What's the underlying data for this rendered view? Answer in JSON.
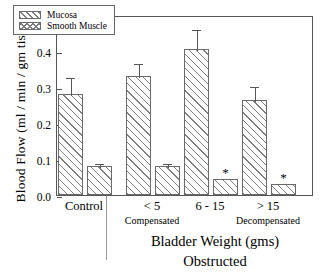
{
  "chart_data": {
    "type": "bar",
    "title": "",
    "xlabel": "Bladder  Weight (gms)",
    "xsublabel": "Obstructed",
    "ylabel": "Blood  Flow  (ml / min / gm tissue)",
    "ylim": [
      0.0,
      0.5
    ],
    "ytick_labels": [
      "0.0",
      "0.1",
      "0.2",
      "0.3",
      "0.4",
      "0.5"
    ],
    "ytick_values": [
      0.0,
      0.1,
      0.2,
      0.3,
      0.4,
      0.5
    ],
    "grid": false,
    "legend_position": "upper-left",
    "categories": [
      "Control",
      "< 5",
      "6 - 15",
      "> 15"
    ],
    "category_sublabels": [
      "",
      "Compensated",
      "",
      "Decompensated"
    ],
    "series": [
      {
        "name": "Mucosa",
        "pattern": "diagonal-hatch",
        "values": [
          0.28,
          0.33,
          0.405,
          0.265
        ],
        "errors_upper": [
          0.33,
          0.37,
          0.465,
          0.305
        ],
        "significance": [
          "",
          "",
          "",
          ""
        ]
      },
      {
        "name": "Smooth  Muscle",
        "pattern": "cross-hatch",
        "values": [
          0.08,
          0.08,
          0.045,
          0.03
        ],
        "errors_upper": [
          0.092,
          0.092,
          0.0,
          0.0
        ],
        "significance": [
          "",
          "",
          "*",
          "*"
        ]
      }
    ],
    "significance_marker": "*"
  },
  "legend": {
    "items": [
      {
        "label": "Mucosa"
      },
      {
        "label": "Smooth  Muscle"
      }
    ]
  },
  "axis": {
    "y_title": "Blood  Flow  (ml / min / gm tissue)",
    "x_title": "Bladder  Weight (gms)",
    "x_subtitle": "Obstructed"
  },
  "colors": {
    "hatch": "#7d7d7d",
    "axis": "#555555",
    "background": "#ffffff",
    "text": "#000000"
  }
}
